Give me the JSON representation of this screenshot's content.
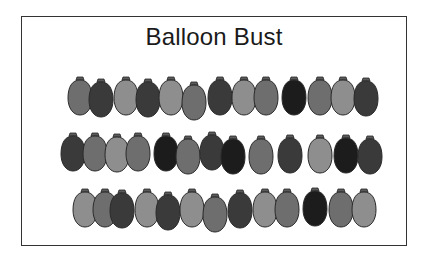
{
  "title": "Balloon Bust",
  "colors": {
    "light": "#8e8e8e",
    "mid": "#6e6e6e",
    "dark": "#3a3a3a",
    "black": "#1c1c1c",
    "outline": "#2a2a2a",
    "knot": "#5a5a5a"
  },
  "rows": [
    {
      "y": 78,
      "balloons": [
        {
          "x": 80,
          "shade": "mid",
          "dy": 0
        },
        {
          "x": 101,
          "shade": "dark",
          "dy": 2
        },
        {
          "x": 126,
          "shade": "light",
          "dy": 0
        },
        {
          "x": 148,
          "shade": "dark",
          "dy": 2
        },
        {
          "x": 171,
          "shade": "light",
          "dy": 0
        },
        {
          "x": 194,
          "shade": "mid",
          "dy": 5
        },
        {
          "x": 220,
          "shade": "dark",
          "dy": 0
        },
        {
          "x": 244,
          "shade": "light",
          "dy": 0
        },
        {
          "x": 266,
          "shade": "mid",
          "dy": 0
        },
        {
          "x": 294,
          "shade": "black",
          "dy": 0
        },
        {
          "x": 320,
          "shade": "mid",
          "dy": 0
        },
        {
          "x": 343,
          "shade": "light",
          "dy": 0
        },
        {
          "x": 366,
          "shade": "dark",
          "dy": 1
        }
      ]
    },
    {
      "y": 134,
      "balloons": [
        {
          "x": 73,
          "shade": "dark",
          "dy": 0
        },
        {
          "x": 95,
          "shade": "mid",
          "dy": 0
        },
        {
          "x": 117,
          "shade": "light",
          "dy": 1
        },
        {
          "x": 138,
          "shade": "mid",
          "dy": 0
        },
        {
          "x": 166,
          "shade": "black",
          "dy": 0
        },
        {
          "x": 188,
          "shade": "mid",
          "dy": 3
        },
        {
          "x": 212,
          "shade": "dark",
          "dy": -1
        },
        {
          "x": 233,
          "shade": "black",
          "dy": 3
        },
        {
          "x": 261,
          "shade": "mid",
          "dy": 3
        },
        {
          "x": 290,
          "shade": "dark",
          "dy": 2
        },
        {
          "x": 320,
          "shade": "light",
          "dy": 2
        },
        {
          "x": 346,
          "shade": "black",
          "dy": 2
        },
        {
          "x": 370,
          "shade": "dark",
          "dy": 3
        }
      ]
    },
    {
      "y": 190,
      "balloons": [
        {
          "x": 85,
          "shade": "light",
          "dy": 0
        },
        {
          "x": 105,
          "shade": "mid",
          "dy": 0
        },
        {
          "x": 122,
          "shade": "dark",
          "dy": 1
        },
        {
          "x": 147,
          "shade": "light",
          "dy": 0
        },
        {
          "x": 168,
          "shade": "dark",
          "dy": 3
        },
        {
          "x": 192,
          "shade": "light",
          "dy": 0
        },
        {
          "x": 215,
          "shade": "mid",
          "dy": 5
        },
        {
          "x": 240,
          "shade": "dark",
          "dy": 1
        },
        {
          "x": 265,
          "shade": "light",
          "dy": 0
        },
        {
          "x": 287,
          "shade": "mid",
          "dy": 0
        },
        {
          "x": 315,
          "shade": "black",
          "dy": -1
        },
        {
          "x": 341,
          "shade": "mid",
          "dy": 0
        },
        {
          "x": 364,
          "shade": "light",
          "dy": 0
        }
      ]
    }
  ]
}
